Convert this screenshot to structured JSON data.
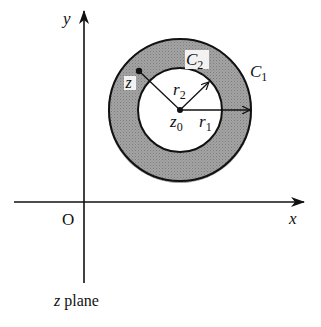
{
  "diagram": {
    "plane_label": "z plane",
    "axes": {
      "x_label": "x",
      "y_label": "y",
      "origin_label": "O"
    },
    "circles": {
      "outer": {
        "label": "C",
        "subscript": "1",
        "radius_label": "r",
        "radius_sub": "1"
      },
      "inner": {
        "label": "C",
        "subscript": "2",
        "radius_label": "r",
        "radius_sub": "2"
      }
    },
    "center": {
      "label": "z",
      "subscript": "0"
    },
    "point": {
      "label": "z"
    },
    "colors": {
      "annulus_fill": "#9a9a9a",
      "stroke": "#111111",
      "background": "#ffffff"
    }
  }
}
